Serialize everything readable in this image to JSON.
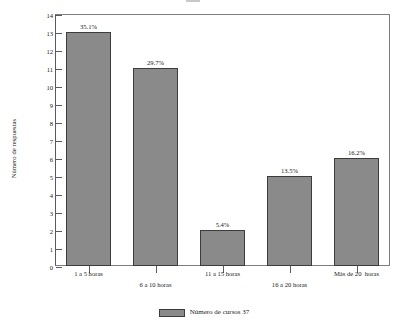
{
  "chart_data": {
    "type": "bar",
    "title": "",
    "xlabel": "",
    "ylabel": "Número de respuestas",
    "categories": [
      "1 a 5 horas",
      "6 a 10 horas",
      "11 a 15 horas",
      "16 a 20 horas",
      "Más de 20  horas"
    ],
    "values": [
      13,
      11,
      2,
      5,
      6
    ],
    "data_labels": [
      "35.1%",
      "29.7%",
      "5.4%",
      "13.5%",
      "16.2%"
    ],
    "ylim": [
      0,
      14
    ],
    "ytick_labels": [
      "14",
      "13",
      "12",
      "11",
      "10",
      "9",
      "8",
      "7",
      "6",
      "5",
      "4",
      "3",
      "2",
      "1",
      "0"
    ],
    "ytick_values": [
      14,
      13,
      12,
      11,
      10,
      9,
      8,
      7,
      6,
      5,
      4,
      3,
      2,
      1,
      0
    ],
    "grid": false,
    "legend_position": "bottom",
    "series": [
      {
        "name": "Número de cursos 37",
        "values": [
          13,
          11,
          2,
          5,
          6
        ]
      }
    ],
    "colors": {
      "bar_fill": "#8a8a8a",
      "bar_border": "#3c3c3c",
      "frame": "#7d7d7d",
      "axis": "#5a5a5a",
      "text": "#1a1a1a",
      "background": "#ffffff"
    }
  },
  "legend": {
    "entries": [
      {
        "label": "Número de cursos 37"
      }
    ]
  }
}
